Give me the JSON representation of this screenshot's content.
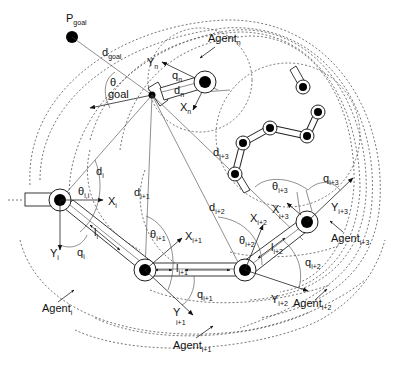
{
  "figure": {
    "goal_label": "P",
    "goal_sub": "goal",
    "d_goal": "d",
    "d_goal_sub": "goal",
    "theta_goal": "θ",
    "theta_goal_sub": "goal",
    "agents": [
      {
        "id": "i",
        "label": "Agent",
        "sub": "i",
        "X": "X",
        "X_sub": "i",
        "Y": "Y",
        "Y_sub": "i",
        "q": "q",
        "q_sub": "i",
        "theta": "θ",
        "theta_sub": "i",
        "d": "d",
        "d_sub": "i",
        "l": "l",
        "l_sub": "i"
      },
      {
        "id": "i+1",
        "label": "Agent",
        "sub": "i+1",
        "X": "X",
        "X_sub": "i+1",
        "Y": "Y",
        "Y_sub": "i+1",
        "q": "q",
        "q_sub": "i+1",
        "theta": "θ",
        "theta_sub": "i+1",
        "d": "d",
        "d_sub": "i+1",
        "l": "l",
        "l_sub": "i+1"
      },
      {
        "id": "i+2",
        "label": "Agent",
        "sub": "i+2",
        "X": "X",
        "X_sub": "i+2",
        "Y": "Y",
        "Y_sub": "i+2",
        "q": "q",
        "q_sub": "i+2",
        "theta": "θ",
        "theta_sub": "i+2",
        "d": "d",
        "d_sub": "i+2",
        "l": "l",
        "l_sub": "i+2"
      },
      {
        "id": "i+3",
        "label": "Agent",
        "sub": "i+3",
        "X": "X",
        "X_sub": "i+3",
        "Y": "Y",
        "Y_sub": "i+3",
        "q": "q",
        "q_sub": "i+3",
        "theta": "θ",
        "theta_sub": "i+3",
        "d": "d",
        "d_sub": "i+3"
      },
      {
        "id": "n",
        "label": "Agent",
        "sub": "n",
        "X": "X",
        "X_sub": "n",
        "Y": "Y",
        "Y_sub": "n",
        "q": "q",
        "q_sub": "n",
        "d": "d",
        "d_sub": "n"
      }
    ],
    "theta_i_sub": "i,i"
  },
  "colors": {
    "stroke": "#222222",
    "dotted": "#555555",
    "fill_joint": "#000000",
    "background": "#ffffff"
  }
}
